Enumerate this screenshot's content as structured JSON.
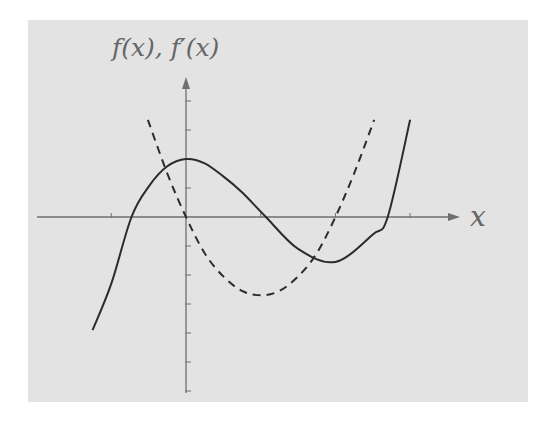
{
  "chart_data": {
    "type": "line",
    "title": "",
    "xlabel": "x",
    "ylabel": "f(x), f'(x)",
    "grid": false,
    "legend": null,
    "x_ticks": [
      -1,
      0,
      1,
      2,
      3
    ],
    "y_ticks": [
      -6,
      -5,
      -4,
      -3,
      -2,
      -1,
      0,
      1,
      2,
      3,
      4
    ],
    "xlim": [
      -1.9,
      4.1
    ],
    "ylim": [
      -6.2,
      5.0
    ],
    "series": [
      {
        "name": "f(x)",
        "style": "solid",
        "x": [
          -1.25,
          -1.0,
          -0.73,
          -0.5,
          -0.25,
          0,
          0.25,
          0.5,
          0.75,
          1.07,
          1.5,
          2.0,
          2.5,
          2.7,
          3.0
        ],
        "y": [
          -3.9,
          -2.3,
          0,
          1.05,
          1.75,
          2.0,
          1.85,
          1.4,
          0.85,
          0,
          -1.1,
          -1.55,
          -0.6,
          0,
          3.35
        ]
      },
      {
        "name": "f'(x)",
        "style": "dashed",
        "x": [
          -0.51,
          -0.25,
          0,
          0.25,
          0.5,
          0.75,
          1.0,
          1.25,
          1.5,
          1.75,
          2.0,
          2.25,
          2.52
        ],
        "y": [
          3.35,
          1.5,
          0,
          -1.25,
          -2.05,
          -2.55,
          -2.7,
          -2.55,
          -2.05,
          -1.25,
          0,
          1.5,
          3.35
        ]
      }
    ]
  },
  "labels": {
    "y_axis": "f(x), f′(x)",
    "x_axis": "x"
  },
  "colors": {
    "panel": "#e3e3e3",
    "axis": "#6f6f6f",
    "curve": "#2b2b2b",
    "label": "#666666"
  }
}
